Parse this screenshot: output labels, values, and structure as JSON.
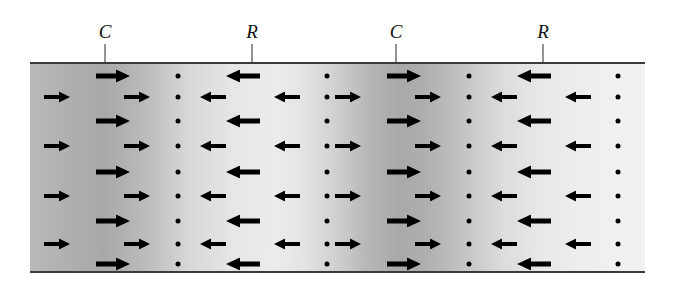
{
  "figure": {
    "width": 673,
    "height": 287,
    "background_color": "#ffffff",
    "line_color": "#3a3a3a",
    "mark_color": "#000000"
  },
  "band": {
    "x": 30,
    "y": 62,
    "width": 615,
    "height": 211,
    "top_rule_y": 62,
    "bottom_rule_y": 271,
    "gradient_css": "linear-gradient(to right, #b9b9b9 0%, #b0b0b0 6%, #a8a8a8 12%, #bcbcbc 19%, #d8d8d8 26%, #e6e6e6 33%, #ececec 40%, #e2e2e2 45%, #cfcfcf 50%, #b6b6b6 55%, #a9a9a9 60%, #aeaeae 64%, #c2c2c2 70%, #dcdcdc 77%, #e9e9e9 84%, #efefef 92%, #f1f1f1 100%)",
    "dark_regions_note": "Compressions appear as darker vertical bands; rarefactions as lighter bands"
  },
  "labels": [
    {
      "text": "C",
      "meaning": "compression",
      "x": 105,
      "text_y": 22,
      "tick_top": 44,
      "tick_bottom": 62
    },
    {
      "text": "R",
      "meaning": "rarefaction",
      "x": 252,
      "text_y": 22,
      "tick_top": 44,
      "tick_bottom": 62
    },
    {
      "text": "C",
      "meaning": "compression",
      "x": 396,
      "text_y": 22,
      "tick_top": 44,
      "tick_bottom": 62
    },
    {
      "text": "R",
      "meaning": "rarefaction",
      "x": 543,
      "text_y": 22,
      "tick_top": 44,
      "tick_bottom": 62
    }
  ],
  "legend_note": "C = compression (particles bunched, displacement arrows converge), R = rarefaction (particles spread apart)",
  "rows": [
    {
      "y": 76,
      "kind": "odd",
      "marks": [
        {
          "type": "arrow-right",
          "x": 113,
          "size": "large"
        },
        {
          "type": "dot",
          "x": 178
        },
        {
          "type": "arrow-left",
          "x": 243,
          "size": "large"
        },
        {
          "type": "dot",
          "x": 327
        },
        {
          "type": "arrow-right",
          "x": 404,
          "size": "large"
        },
        {
          "type": "dot",
          "x": 469
        },
        {
          "type": "arrow-left",
          "x": 534,
          "size": "large"
        },
        {
          "type": "dot",
          "x": 618
        }
      ]
    },
    {
      "y": 97,
      "kind": "even",
      "marks": [
        {
          "type": "arrow-right",
          "x": 57,
          "size": "small"
        },
        {
          "type": "arrow-right",
          "x": 137,
          "size": "small"
        },
        {
          "type": "dot",
          "x": 178
        },
        {
          "type": "arrow-left",
          "x": 213,
          "size": "small"
        },
        {
          "type": "arrow-left",
          "x": 287,
          "size": "small"
        },
        {
          "type": "dot",
          "x": 327
        },
        {
          "type": "arrow-right",
          "x": 348,
          "size": "small"
        },
        {
          "type": "arrow-right",
          "x": 428,
          "size": "small"
        },
        {
          "type": "dot",
          "x": 469
        },
        {
          "type": "arrow-left",
          "x": 504,
          "size": "small"
        },
        {
          "type": "arrow-left",
          "x": 578,
          "size": "small"
        },
        {
          "type": "dot",
          "x": 618
        }
      ]
    },
    {
      "y": 121,
      "kind": "odd",
      "marks": [
        {
          "type": "arrow-right",
          "x": 113,
          "size": "large"
        },
        {
          "type": "dot",
          "x": 178
        },
        {
          "type": "arrow-left",
          "x": 243,
          "size": "large"
        },
        {
          "type": "dot",
          "x": 327
        },
        {
          "type": "arrow-right",
          "x": 404,
          "size": "large"
        },
        {
          "type": "dot",
          "x": 469
        },
        {
          "type": "arrow-left",
          "x": 534,
          "size": "large"
        },
        {
          "type": "dot",
          "x": 618
        }
      ]
    },
    {
      "y": 146,
      "kind": "even",
      "marks": [
        {
          "type": "arrow-right",
          "x": 57,
          "size": "small"
        },
        {
          "type": "arrow-right",
          "x": 137,
          "size": "small"
        },
        {
          "type": "dot",
          "x": 178
        },
        {
          "type": "arrow-left",
          "x": 213,
          "size": "small"
        },
        {
          "type": "arrow-left",
          "x": 287,
          "size": "small"
        },
        {
          "type": "dot",
          "x": 327
        },
        {
          "type": "arrow-right",
          "x": 348,
          "size": "small"
        },
        {
          "type": "arrow-right",
          "x": 428,
          "size": "small"
        },
        {
          "type": "dot",
          "x": 469
        },
        {
          "type": "arrow-left",
          "x": 504,
          "size": "small"
        },
        {
          "type": "arrow-left",
          "x": 578,
          "size": "small"
        },
        {
          "type": "dot",
          "x": 618
        }
      ]
    },
    {
      "y": 172,
      "kind": "odd",
      "marks": [
        {
          "type": "arrow-right",
          "x": 113,
          "size": "large"
        },
        {
          "type": "dot",
          "x": 178
        },
        {
          "type": "arrow-left",
          "x": 243,
          "size": "large"
        },
        {
          "type": "dot",
          "x": 327
        },
        {
          "type": "arrow-right",
          "x": 404,
          "size": "large"
        },
        {
          "type": "dot",
          "x": 469
        },
        {
          "type": "arrow-left",
          "x": 534,
          "size": "large"
        },
        {
          "type": "dot",
          "x": 618
        }
      ]
    },
    {
      "y": 196,
      "kind": "even",
      "marks": [
        {
          "type": "arrow-right",
          "x": 57,
          "size": "small"
        },
        {
          "type": "arrow-right",
          "x": 137,
          "size": "small"
        },
        {
          "type": "dot",
          "x": 178
        },
        {
          "type": "arrow-left",
          "x": 213,
          "size": "small"
        },
        {
          "type": "arrow-left",
          "x": 287,
          "size": "small"
        },
        {
          "type": "dot",
          "x": 327
        },
        {
          "type": "arrow-right",
          "x": 348,
          "size": "small"
        },
        {
          "type": "arrow-right",
          "x": 428,
          "size": "small"
        },
        {
          "type": "dot",
          "x": 469
        },
        {
          "type": "arrow-left",
          "x": 504,
          "size": "small"
        },
        {
          "type": "arrow-left",
          "x": 578,
          "size": "small"
        },
        {
          "type": "dot",
          "x": 618
        }
      ]
    },
    {
      "y": 221,
      "kind": "odd",
      "marks": [
        {
          "type": "arrow-right",
          "x": 113,
          "size": "large"
        },
        {
          "type": "dot",
          "x": 178
        },
        {
          "type": "arrow-left",
          "x": 243,
          "size": "large"
        },
        {
          "type": "dot",
          "x": 327
        },
        {
          "type": "arrow-right",
          "x": 404,
          "size": "large"
        },
        {
          "type": "dot",
          "x": 469
        },
        {
          "type": "arrow-left",
          "x": 534,
          "size": "large"
        },
        {
          "type": "dot",
          "x": 618
        }
      ]
    },
    {
      "y": 244,
      "kind": "even",
      "marks": [
        {
          "type": "arrow-right",
          "x": 57,
          "size": "small"
        },
        {
          "type": "arrow-right",
          "x": 137,
          "size": "small"
        },
        {
          "type": "dot",
          "x": 178
        },
        {
          "type": "arrow-left",
          "x": 213,
          "size": "small"
        },
        {
          "type": "arrow-left",
          "x": 287,
          "size": "small"
        },
        {
          "type": "dot",
          "x": 327
        },
        {
          "type": "arrow-right",
          "x": 348,
          "size": "small"
        },
        {
          "type": "arrow-right",
          "x": 428,
          "size": "small"
        },
        {
          "type": "dot",
          "x": 469
        },
        {
          "type": "arrow-left",
          "x": 504,
          "size": "small"
        },
        {
          "type": "arrow-left",
          "x": 578,
          "size": "small"
        },
        {
          "type": "dot",
          "x": 618
        }
      ]
    },
    {
      "y": 264,
      "kind": "odd",
      "marks": [
        {
          "type": "arrow-right",
          "x": 113,
          "size": "large"
        },
        {
          "type": "dot",
          "x": 178
        },
        {
          "type": "arrow-left",
          "x": 243,
          "size": "large"
        },
        {
          "type": "dot",
          "x": 327
        },
        {
          "type": "arrow-right",
          "x": 404,
          "size": "large"
        },
        {
          "type": "dot",
          "x": 469
        },
        {
          "type": "arrow-left",
          "x": 534,
          "size": "large"
        },
        {
          "type": "dot",
          "x": 618
        }
      ]
    }
  ],
  "mark_styles": {
    "large": {
      "width": 34,
      "height": 13,
      "shaft_thickness": 5
    },
    "small": {
      "width": 26,
      "height": 11,
      "shaft_thickness": 4
    },
    "dot": {
      "diameter": 5
    }
  }
}
